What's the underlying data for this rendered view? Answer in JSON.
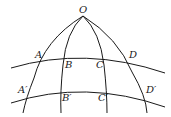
{
  "diagram": {
    "type": "spherical-grid",
    "stroke_color": "#1a1a1a",
    "background": "#ffffff",
    "points": {
      "O": {
        "label": "O",
        "x": 83,
        "y": 16
      },
      "A": {
        "label": "A",
        "x": 42,
        "y": 60
      },
      "B": {
        "label": "B",
        "x": 64,
        "y": 57
      },
      "C": {
        "label": "C",
        "x": 104,
        "y": 57
      },
      "D": {
        "label": "D",
        "x": 127,
        "y": 61
      },
      "A_prime": {
        "label": "A′",
        "x": 27,
        "y": 94
      },
      "B_prime": {
        "label": "B′",
        "x": 61,
        "y": 89
      },
      "C_prime": {
        "label": "C′",
        "x": 105,
        "y": 89
      },
      "D_prime": {
        "label": "D′",
        "x": 143,
        "y": 94
      }
    },
    "meridians": [
      "OAA′",
      "OBB′",
      "OCC′",
      "ODD′"
    ],
    "parallels": [
      "ABCD",
      "A′B′C′D′"
    ]
  }
}
